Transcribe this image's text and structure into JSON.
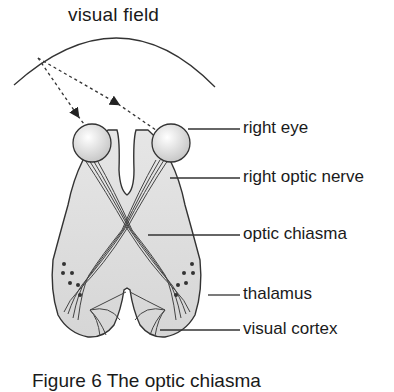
{
  "diagram": {
    "title": "visual field",
    "labels": [
      {
        "id": "right-eye",
        "text": "right eye"
      },
      {
        "id": "right-optic-nerve",
        "text": "right optic nerve"
      },
      {
        "id": "optic-chiasma",
        "text": "optic chiasma"
      },
      {
        "id": "thalamus",
        "text": "thalamus"
      },
      {
        "id": "visual-cortex",
        "text": "visual cortex"
      }
    ],
    "caption": "Figure 6 The optic chiasma",
    "colors": {
      "brain_fill": "#dcdcdc",
      "outline": "#333333",
      "text": "#1a1a1a"
    }
  }
}
